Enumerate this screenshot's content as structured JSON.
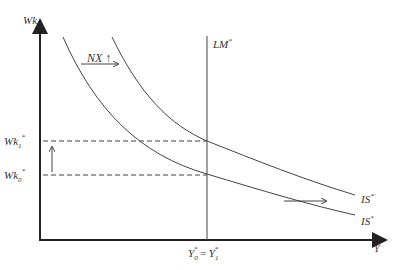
{
  "diagram": {
    "type": "IS-LM (Mundell-Fleming) shift diagram",
    "y_axis_label": "Wk",
    "x_axis_label": "Y",
    "curves": [
      {
        "name": "LM*",
        "label": "LM",
        "sup": "*"
      },
      {
        "name": "IS*",
        "label": "IS",
        "sup": "*"
      },
      {
        "name": "IS*'",
        "label": "IS",
        "sup": "*'"
      }
    ],
    "annotations": {
      "nx_label": "NX",
      "nx_arrow": "↑",
      "wk1_label": "Wk",
      "wk1_sub": "1",
      "wk0_label": "Wk",
      "wk0_sub": "0",
      "star": "*",
      "x_eq_left": "Y",
      "x_eq_left_sub": "0",
      "x_eq_mid": " = ",
      "x_eq_right": "Y",
      "x_eq_right_sub": "1"
    },
    "colors": {
      "axis": "#222222",
      "curve": "#444444",
      "dashed": "#444444"
    }
  }
}
